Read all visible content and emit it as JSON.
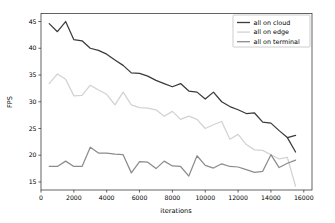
{
  "chart_data": {
    "type": "line",
    "title": "",
    "xlabel": "iterations",
    "ylabel": "FPS",
    "xlim": [
      0,
      16500
    ],
    "ylim": [
      13.5,
      46.5
    ],
    "xticks": [
      0,
      2000,
      4000,
      6000,
      8000,
      10000,
      12000,
      14000,
      16000
    ],
    "xtick_labels": [
      "0",
      "2000",
      "4000",
      "6000",
      "8000",
      "10000",
      "12000",
      "14000",
      "16000"
    ],
    "yticks": [
      15,
      20,
      25,
      30,
      35,
      40,
      45
    ],
    "ytick_labels": [
      "15",
      "20",
      "25",
      "30",
      "35",
      "40",
      "45"
    ],
    "grid": false,
    "legend_position": "upper right",
    "x": [
      500,
      1000,
      1500,
      2000,
      2500,
      3000,
      3500,
      4000,
      4500,
      5000,
      5500,
      6000,
      6500,
      7000,
      7500,
      8000,
      8500,
      9000,
      9500,
      10000,
      10500,
      11000,
      11500,
      12000,
      12500,
      13000,
      13500,
      14000,
      14500,
      15000,
      15500
    ],
    "series": [
      {
        "name": "all on cloud",
        "color": "#3a3a3a",
        "values": [
          44.6,
          43.1,
          45.0,
          41.6,
          41.4,
          40.0,
          39.6,
          38.9,
          37.8,
          36.8,
          35.4,
          35.3,
          34.8,
          34.0,
          33.4,
          32.8,
          33.4,
          32.0,
          31.8,
          30.5,
          31.8,
          30.0,
          29.1,
          28.5,
          27.8,
          27.9,
          26.2,
          26.0,
          24.6,
          23.3,
          23.7
        ]
      },
      {
        "name": "all on edge",
        "color": "#d2d2d2",
        "values": [
          33.4,
          35.2,
          34.2,
          31.1,
          31.2,
          33.1,
          32.2,
          31.4,
          29.4,
          31.8,
          29.4,
          28.9,
          28.8,
          28.5,
          27.3,
          28.2,
          26.7,
          27.3,
          26.7,
          25.0,
          25.7,
          26.3,
          23.0,
          23.9,
          22.0,
          21.0,
          20.9,
          20.1,
          19.3,
          19.6,
          14.2
        ]
      },
      {
        "name": "all on terminal",
        "color": "#8c8c8c",
        "values": [
          17.9,
          17.9,
          18.9,
          17.9,
          17.9,
          21.5,
          20.4,
          20.4,
          20.2,
          20.1,
          16.7,
          18.8,
          18.7,
          17.5,
          18.9,
          18.0,
          17.9,
          16.1,
          19.9,
          18.1,
          17.6,
          18.4,
          17.9,
          17.8,
          17.3,
          16.8,
          17.0,
          20.1,
          17.7,
          18.5,
          19.1
        ]
      }
    ],
    "tail_segments": [
      {
        "name": "all on cloud",
        "x": [
          15000,
          15500
        ],
        "values": [
          23.3,
          20.6
        ]
      }
    ]
  },
  "legend": {
    "entries": [
      "all on cloud",
      "all on edge",
      "all on terminal"
    ]
  }
}
